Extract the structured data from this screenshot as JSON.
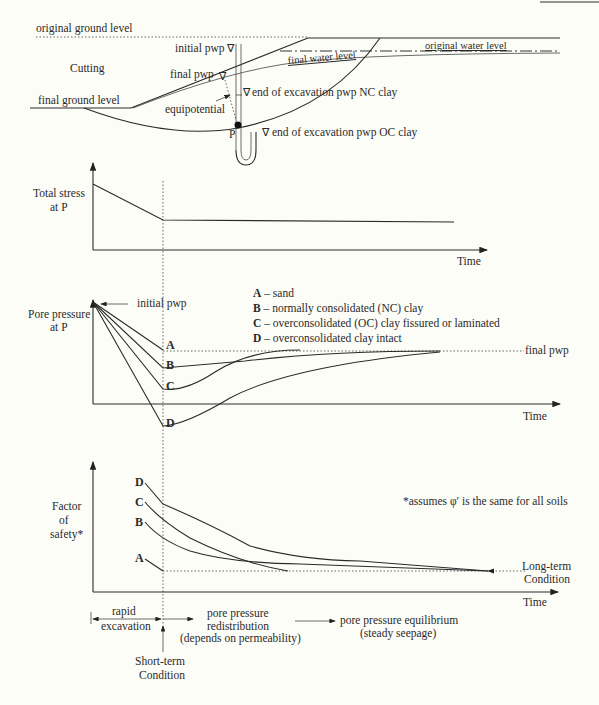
{
  "section_diagram": {
    "original_ground_level": "original ground level",
    "cutting": "Cutting",
    "final_ground_level": "final ground level",
    "initial_pwp": "initial pwp",
    "final_pwp": "final pwp",
    "equipotential": "equipotential",
    "original_water_level": "original water level",
    "final_water_level": "final water level",
    "eoe_nc": "end of excavation pwp NC clay",
    "eoe_oc": "end of excavation pwp OC clay",
    "point_p": "P"
  },
  "total_stress_plot": {
    "ylabel_line1": "Total stress",
    "ylabel_line2": "at P",
    "xlabel": "Time"
  },
  "pore_pressure_plot": {
    "ylabel_line1": "Pore pressure",
    "ylabel_line2": "at P",
    "xlabel": "Time",
    "initial_pwp": "initial pwp",
    "final_pwp": "final pwp",
    "legend": [
      {
        "key": "A",
        "text": " – sand"
      },
      {
        "key": "B",
        "text": " – normally consolidated (NC) clay"
      },
      {
        "key": "C",
        "text": " – overconsolidated (OC) clay fissured or laminated"
      },
      {
        "key": "D",
        "text": " – overconsolidated clay  intact"
      }
    ],
    "curve_labels": [
      "A",
      "B",
      "C",
      "D"
    ]
  },
  "fos_plot": {
    "ylabel_line1": "Factor",
    "ylabel_line2": "of",
    "ylabel_line3": "safety*",
    "xlabel": "Time",
    "note": "*assumes φ′ is the same for all soils",
    "long_term_line1": "Long-term",
    "long_term_line2": "Condition",
    "curve_labels": [
      "D",
      "C",
      "B",
      "A"
    ]
  },
  "phases": {
    "rapid_line1": "rapid",
    "rapid_line2": "excavation",
    "redist_line1": "pore pressure",
    "redist_line2": "redistribution",
    "redist_line3": "(depends on permeability)",
    "equil_line1": "pore pressure equilibrium",
    "equil_line2": "(steady seepage)",
    "short_term_line1": "Short-term",
    "short_term_line2": "Condition"
  }
}
